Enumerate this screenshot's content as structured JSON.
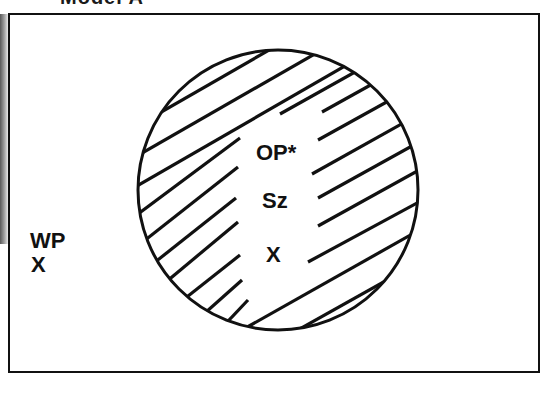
{
  "figure": {
    "caption_partial": "Model A",
    "outside_labels": [
      "WP",
      "X"
    ],
    "circle_labels": [
      "OP*",
      "Sz",
      "X"
    ],
    "circle_fill": "diagonal-hatch",
    "colors": {
      "ink": "#111111",
      "background": "#ffffff"
    }
  }
}
